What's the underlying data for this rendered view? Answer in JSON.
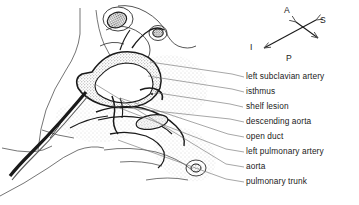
{
  "figure": {
    "type": "anatomical-line-drawing",
    "style": "pen-and-ink stipple shading, grayscale"
  },
  "compass": {
    "name": "orientation-compass",
    "axes": [
      {
        "key": "A",
        "label": "A",
        "meaning": "anterior",
        "x": 286,
        "y": 8
      },
      {
        "key": "S",
        "label": "S",
        "meaning": "superior",
        "x": 322,
        "y": 18
      },
      {
        "key": "I",
        "label": "I",
        "meaning": "inferior",
        "x": 252,
        "y": 46
      },
      {
        "key": "P",
        "label": "P",
        "meaning": "posterior",
        "x": 288,
        "y": 57
      }
    ]
  },
  "labels": [
    {
      "id": "left-subclavian-artery",
      "text": "left subclavian artery",
      "x": 246,
      "y": 73,
      "leader_from": [
        150,
        62
      ],
      "leader_to": [
        244,
        77
      ],
      "arrow": false
    },
    {
      "id": "isthmus",
      "text": "isthmus",
      "x": 246,
      "y": 88,
      "leader_from": [
        148,
        76
      ],
      "leader_to": [
        244,
        92
      ],
      "arrow": false
    },
    {
      "id": "shelf-lesion",
      "text": "shelf lesion",
      "x": 246,
      "y": 103,
      "leader_from": [
        150,
        92
      ],
      "leader_to": [
        244,
        107
      ],
      "arrow": true
    },
    {
      "id": "descending-aorta",
      "text": "descending aorta",
      "x": 246,
      "y": 118,
      "leader_from": [
        128,
        108
      ],
      "leader_to": [
        244,
        122
      ],
      "arrow": false
    },
    {
      "id": "open-duct",
      "text": "open duct",
      "x": 246,
      "y": 133,
      "leader_from": [
        120,
        98
      ],
      "leader_to": [
        244,
        137
      ],
      "arrow": false
    },
    {
      "id": "left-pulmonary-artery",
      "text": "left pulmonary artery",
      "x": 246,
      "y": 148,
      "leader_from": [
        112,
        105
      ],
      "leader_to": [
        244,
        152
      ],
      "arrow": false
    },
    {
      "id": "aorta",
      "text": "aorta",
      "x": 246,
      "y": 163,
      "leader_from": [
        95,
        84
      ],
      "leader_to": [
        244,
        167
      ],
      "arrow": false
    },
    {
      "id": "pulmonary-trunk",
      "text": "pulmonary trunk",
      "x": 246,
      "y": 178,
      "leader_from": [
        118,
        140
      ],
      "leader_to": [
        244,
        182
      ],
      "arrow": false
    }
  ],
  "colors": {
    "background": "#ffffff",
    "ink": "#1a1a1a",
    "leader_line": "#6b6b6b",
    "stipple_light": "#cfcfcf",
    "stipple_mid": "#a6a6a6",
    "stipple_dark": "#6e6e6e"
  }
}
